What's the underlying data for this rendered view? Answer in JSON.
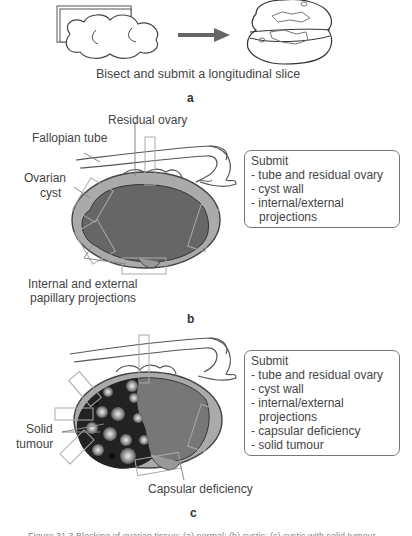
{
  "panel_a": {
    "caption": "Bisect and submit a longitudinal slice",
    "label": "a"
  },
  "panel_b": {
    "labels": {
      "residual_ovary": "Residual ovary",
      "fallopian_tube": "Fallopian tube",
      "ovarian_cyst_1": "Ovarian",
      "ovarian_cyst_2": "cyst",
      "papillary_1": "Internal and external",
      "papillary_2": "papillary projections"
    },
    "submit_box": {
      "title": "Submit",
      "items": [
        "- tube and residual ovary",
        "- cyst wall",
        "- internal/external",
        "projections"
      ]
    },
    "label": "b"
  },
  "panel_c": {
    "labels": {
      "solid_1": "Solid",
      "solid_2": "tumour",
      "capsular": "Capsular deficiency"
    },
    "submit_box": {
      "title": "Submit",
      "items": [
        "- tube and residual ovary",
        "- cyst wall",
        "- internal/external",
        "projections",
        "- capsular deficiency",
        "- solid tumour"
      ]
    },
    "label": "c"
  },
  "figure_caption": "Figure 31.3    Blocking of ovarian tissue: (a) normal; (b) cystic; (c) cystic with solid tumour"
}
